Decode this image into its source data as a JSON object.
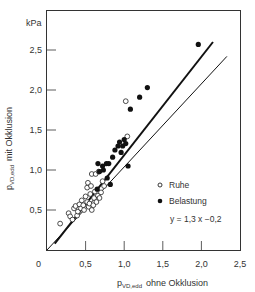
{
  "chart_data": {
    "type": "scatter",
    "title": "",
    "xlabel": "p_VD,edd ohne Okklusion",
    "ylabel": "p_VD,edd mit Okklusion",
    "xlabel_main": "p",
    "xlabel_sub": "VD,edd",
    "xlabel_rest": "ohne Okklusion",
    "ylabel_main": "p",
    "ylabel_sub": "VD,edd",
    "ylabel_rest": "mit Okklusion",
    "y_unit": "kPa",
    "xlim": [
      0,
      2.5
    ],
    "ylim": [
      0,
      2.75
    ],
    "x_ticks": [
      0.5,
      1.0,
      1.5,
      2.0,
      2.5
    ],
    "x_tick_labels": [
      "0,5",
      "1,0",
      "1,5",
      "2,0",
      "2,5"
    ],
    "y_ticks": [
      0.5,
      1.0,
      1.5,
      2.0,
      2.5
    ],
    "y_tick_labels": [
      "0,5",
      "1,0",
      "1,5",
      "2,0",
      "2,5"
    ],
    "origin_label": "0",
    "grid": false,
    "legend_position": "lower right",
    "legend": [
      {
        "label": "Ruhe",
        "marker": "open-circle"
      },
      {
        "label": "Belastung",
        "marker": "filled-circle"
      }
    ],
    "annotations": [
      "y = 1,3 x −0,2"
    ],
    "lines": [
      {
        "name": "regression",
        "equation": "y = 1.3x - 0.2",
        "x": [
          0.1,
          2.15
        ],
        "y": [
          0.08,
          2.6
        ],
        "width": 2
      },
      {
        "name": "identity",
        "equation": "y = x",
        "x": [
          0.0,
          2.33
        ],
        "y": [
          0.0,
          2.42
        ],
        "width": 1
      }
    ],
    "series": [
      {
        "name": "Ruhe",
        "marker": "open",
        "points": [
          [
            0.17,
            0.33
          ],
          [
            0.28,
            0.46
          ],
          [
            0.3,
            0.42
          ],
          [
            0.33,
            0.38
          ],
          [
            0.35,
            0.52
          ],
          [
            0.37,
            0.55
          ],
          [
            0.39,
            0.43
          ],
          [
            0.4,
            0.48
          ],
          [
            0.42,
            0.57
          ],
          [
            0.44,
            0.52
          ],
          [
            0.45,
            0.62
          ],
          [
            0.47,
            0.56
          ],
          [
            0.48,
            0.5
          ],
          [
            0.5,
            0.67
          ],
          [
            0.52,
            0.6
          ],
          [
            0.52,
            0.78
          ],
          [
            0.53,
            0.84
          ],
          [
            0.54,
            0.54
          ],
          [
            0.55,
            0.58
          ],
          [
            0.56,
            0.7
          ],
          [
            0.57,
            0.8
          ],
          [
            0.58,
            0.95
          ],
          [
            0.58,
            0.5
          ],
          [
            0.6,
            0.56
          ],
          [
            0.61,
            0.65
          ],
          [
            0.62,
            0.73
          ],
          [
            0.63,
            0.95
          ],
          [
            0.64,
            0.6
          ],
          [
            0.66,
            0.68
          ],
          [
            0.67,
            0.98
          ],
          [
            0.68,
            0.65
          ],
          [
            0.7,
            0.72
          ],
          [
            0.72,
            0.86
          ],
          [
            0.74,
            0.8
          ],
          [
            1.02,
            1.86
          ],
          [
            1.04,
            1.42
          ]
        ]
      },
      {
        "name": "Belastung",
        "marker": "filled",
        "points": [
          [
            0.65,
            0.76
          ],
          [
            0.66,
            1.08
          ],
          [
            0.68,
            0.98
          ],
          [
            0.72,
            1.05
          ],
          [
            0.73,
            1.0
          ],
          [
            0.77,
            1.08
          ],
          [
            0.78,
            0.9
          ],
          [
            0.8,
            1.08
          ],
          [
            0.82,
            0.82
          ],
          [
            0.85,
            1.16
          ],
          [
            0.88,
            1.25
          ],
          [
            0.92,
            1.3
          ],
          [
            0.94,
            1.35
          ],
          [
            0.96,
            1.22
          ],
          [
            0.98,
            1.3
          ],
          [
            1.0,
            1.38
          ],
          [
            1.02,
            1.33
          ],
          [
            1.05,
            1.05
          ],
          [
            1.08,
            1.76
          ],
          [
            1.2,
            1.91
          ],
          [
            1.3,
            2.03
          ],
          [
            1.96,
            2.57
          ]
        ]
      }
    ]
  }
}
